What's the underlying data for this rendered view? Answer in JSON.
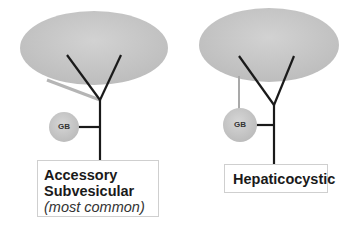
{
  "colors": {
    "liver": "#c6c6c6",
    "gallbladder": "#c9c9c9",
    "duct": "#1a1a1a",
    "accessory_duct": "#b5b5b5",
    "box_border": "#cfcfcf"
  },
  "diagrams": [
    {
      "id": "left",
      "gallbladder_label": "GB",
      "label_lines": [
        "Accessory",
        "Subvesicular"
      ],
      "note": "(most common)"
    },
    {
      "id": "right",
      "gallbladder_label": "GB",
      "label_lines": [
        "Hepaticocystic"
      ],
      "note": ""
    }
  ]
}
